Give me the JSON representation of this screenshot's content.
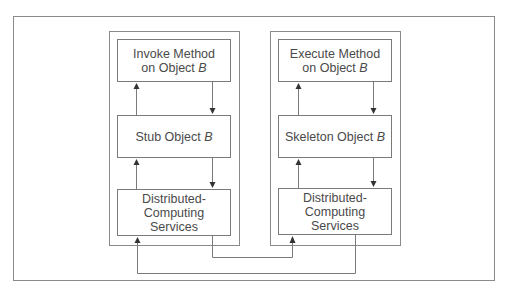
{
  "diagram": {
    "client": {
      "label": "client-side stack",
      "boxes": [
        {
          "line1": "Invoke Method",
          "line2": "on Object ",
          "italic": "B"
        },
        {
          "line1": "Stub Object ",
          "italic": "B"
        },
        {
          "line1": "Distributed-",
          "line2": "Computing",
          "line3": "Services"
        }
      ]
    },
    "server": {
      "label": "server-side stack",
      "boxes": [
        {
          "line1": "Execute Method",
          "line2": "on Object ",
          "italic": "B"
        },
        {
          "line1": "Skeleton Object ",
          "italic": "B"
        },
        {
          "line1": "Distributed-",
          "line2": "Computing",
          "line3": "Services"
        }
      ]
    },
    "colors": {
      "line": "#7a7a7a",
      "frame": "#8a8a8a",
      "text": "#4a4a4a"
    }
  }
}
